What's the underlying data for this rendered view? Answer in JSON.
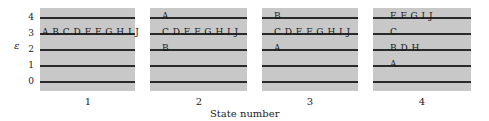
{
  "figure": {
    "ylabel": "ε",
    "xlabel": "State number",
    "y_ticks": [
      "4",
      "3",
      "2",
      "1",
      "0"
    ],
    "panels": [
      {
        "state": "1",
        "levels": {
          "4": "",
          "3": "A B C D E F G H I J",
          "2": "",
          "1": "",
          "0": ""
        }
      },
      {
        "state": "2",
        "levels": {
          "4": "A",
          "3": "C D E F G H I J",
          "2": "B",
          "1": "",
          "0": ""
        }
      },
      {
        "state": "3",
        "levels": {
          "4": "B",
          "3": "C D E F G H I J",
          "2": "A",
          "1": "",
          "0": ""
        }
      },
      {
        "state": "4",
        "levels": {
          "4": "E F G I J",
          "3": "C",
          "2": "B D H",
          "1": "A",
          "0": ""
        }
      }
    ]
  },
  "colors": {
    "panel_bg": "#c8c8c8",
    "line": "#2a2a2a",
    "text": "#222222"
  }
}
